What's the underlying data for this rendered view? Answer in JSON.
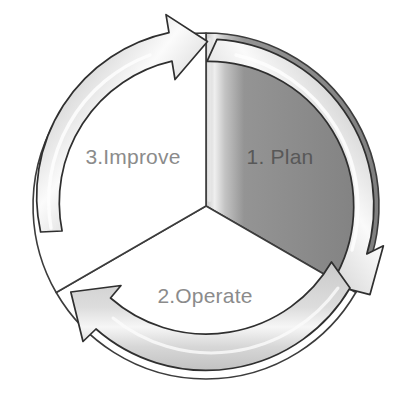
{
  "diagram": {
    "type": "three-stage-cycle",
    "title": "",
    "center": {
      "x": 206,
      "y": 206
    },
    "direction": "clockwise",
    "colors": {
      "page_background": "#ffffff",
      "sector_active_fill": "#8d8d8d",
      "sector_inactive_fill": "#ffffff",
      "sector_highlight": "#cfcfcf",
      "ring_band_fill": "#d9d9d9",
      "ring_band_highlight": "#f4f4f4",
      "outline": "#3a3a3a",
      "label_light": "#8b8b8b",
      "label_dark": "#585858"
    },
    "segments": [
      {
        "id": "plan",
        "label": "1. Plan",
        "order": 1,
        "state": "active",
        "label_color": "#585858",
        "label_x": 280,
        "label_y": 164,
        "start_angle_deg": -90,
        "end_angle_deg": 30
      },
      {
        "id": "operate",
        "label": "2.Operate",
        "order": 2,
        "state": "inactive",
        "label_color": "#8b8b8b",
        "label_x": 205,
        "label_y": 303,
        "start_angle_deg": 30,
        "end_angle_deg": 150
      },
      {
        "id": "improve",
        "label": "3.Improve",
        "order": 3,
        "state": "inactive",
        "label_color": "#8b8b8b",
        "label_x": 133,
        "label_y": 164,
        "start_angle_deg": 150,
        "end_angle_deg": 270
      }
    ],
    "arrows": [
      {
        "id": "arrow-improve-to-plan",
        "points_to": "plan",
        "head_position": "top"
      },
      {
        "id": "arrow-plan-to-operate",
        "points_to": "operate",
        "head_position": "lower-right"
      },
      {
        "id": "arrow-operate-to-improve",
        "points_to": "improve",
        "head_position": "lower-left"
      }
    ]
  }
}
